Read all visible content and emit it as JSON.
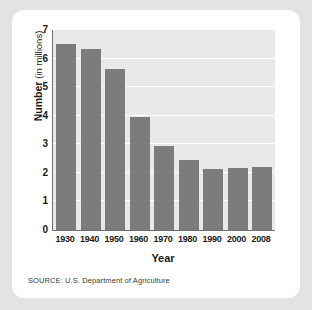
{
  "card": {
    "source_note": "SOURCE: U.S. Department of Agriculture"
  },
  "chart_data": {
    "type": "bar",
    "title": "",
    "subtitle": "",
    "xlabel": "Year",
    "ylabel_bold": "Number",
    "ylabel_light": "(in millions)",
    "ylabel": "Number (in millions)",
    "categories": [
      "1930",
      "1940",
      "1950",
      "1960",
      "1970",
      "1980",
      "1990",
      "2000",
      "2008"
    ],
    "values": [
      6.5,
      6.35,
      5.65,
      3.95,
      2.95,
      2.45,
      2.15,
      2.17,
      2.22
    ],
    "ylim": [
      0,
      7
    ],
    "yticks": [
      "7",
      "6",
      "5",
      "4",
      "3",
      "2",
      "1",
      "0"
    ],
    "ytick_values": [
      7,
      6,
      5,
      4,
      3,
      2,
      1,
      0
    ],
    "grid": "horizontal-white",
    "legend": "none",
    "bar_color": "#7c7c7c",
    "plot_background": "#e9e9e9",
    "gridline_color": "#ffffff",
    "axis_color": "#6f6f6f",
    "card_background": "#ffffff",
    "page_background": "#e3e3e3"
  }
}
